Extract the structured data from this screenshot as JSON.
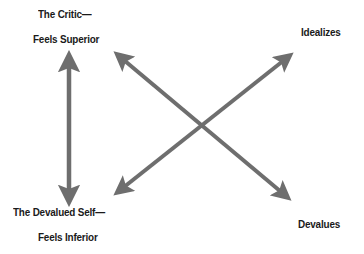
{
  "diagram": {
    "arrow_color": "#6e6e6e",
    "text_color": "#1a1a1a",
    "labels": {
      "critic_line1": "The Critic—",
      "critic_line2": "Feels Superior",
      "idealizes": "Idealizes",
      "devalued_line1": "The Devalued Self—",
      "devalued_line2": "Feels Inferior",
      "devalues": "Devalues"
    },
    "arrows": [
      {
        "name": "critic-devalued-self",
        "from": [
          69,
          52
        ],
        "to": [
          69,
          205
        ],
        "heads": "both"
      },
      {
        "name": "critic-devalues",
        "from": [
          115,
          52
        ],
        "to": [
          290,
          200
        ],
        "heads": "both"
      },
      {
        "name": "idealizes-devalued-self",
        "from": [
          292,
          53
        ],
        "to": [
          115,
          195
        ],
        "heads": "both"
      }
    ]
  }
}
